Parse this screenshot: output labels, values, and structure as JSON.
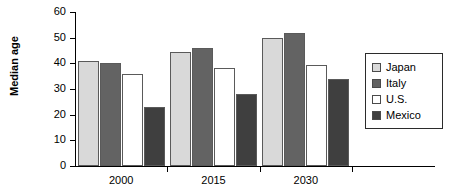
{
  "chart_data": {
    "type": "bar",
    "title": "",
    "subtitle": "",
    "xlabel": "",
    "ylabel": "Median age",
    "categories": [
      "2000",
      "2015",
      "2030"
    ],
    "series": [
      {
        "name": "Japan",
        "values": [
          41,
          44.5,
          50
        ],
        "color": "#d9d9d9"
      },
      {
        "name": "Italy",
        "values": [
          40,
          46,
          52
        ],
        "color": "#636363"
      },
      {
        "name": "U.S.",
        "values": [
          36,
          38,
          39.5
        ],
        "color": "#ffffff"
      },
      {
        "name": "Mexico",
        "values": [
          23,
          28,
          34
        ],
        "color": "#3f3f3f"
      }
    ],
    "ylim": [
      0,
      60
    ],
    "ytick_values": [
      0,
      10,
      20,
      30,
      40,
      50,
      60
    ],
    "ytick_labels": [
      "0",
      "10",
      "20",
      "30",
      "40",
      "50",
      "60"
    ],
    "grid": false,
    "legend_position": "right",
    "annotations": []
  },
  "axes": {
    "y_title": "Median age",
    "y_ticks": [
      "60",
      "50",
      "40",
      "30",
      "20",
      "10",
      "0"
    ],
    "x_ticks": [
      "2000",
      "2015",
      "2030"
    ]
  },
  "legend": {
    "entries": [
      {
        "label": "Japan"
      },
      {
        "label": "Italy"
      },
      {
        "label": "U.S."
      },
      {
        "label": "Mexico"
      }
    ]
  }
}
